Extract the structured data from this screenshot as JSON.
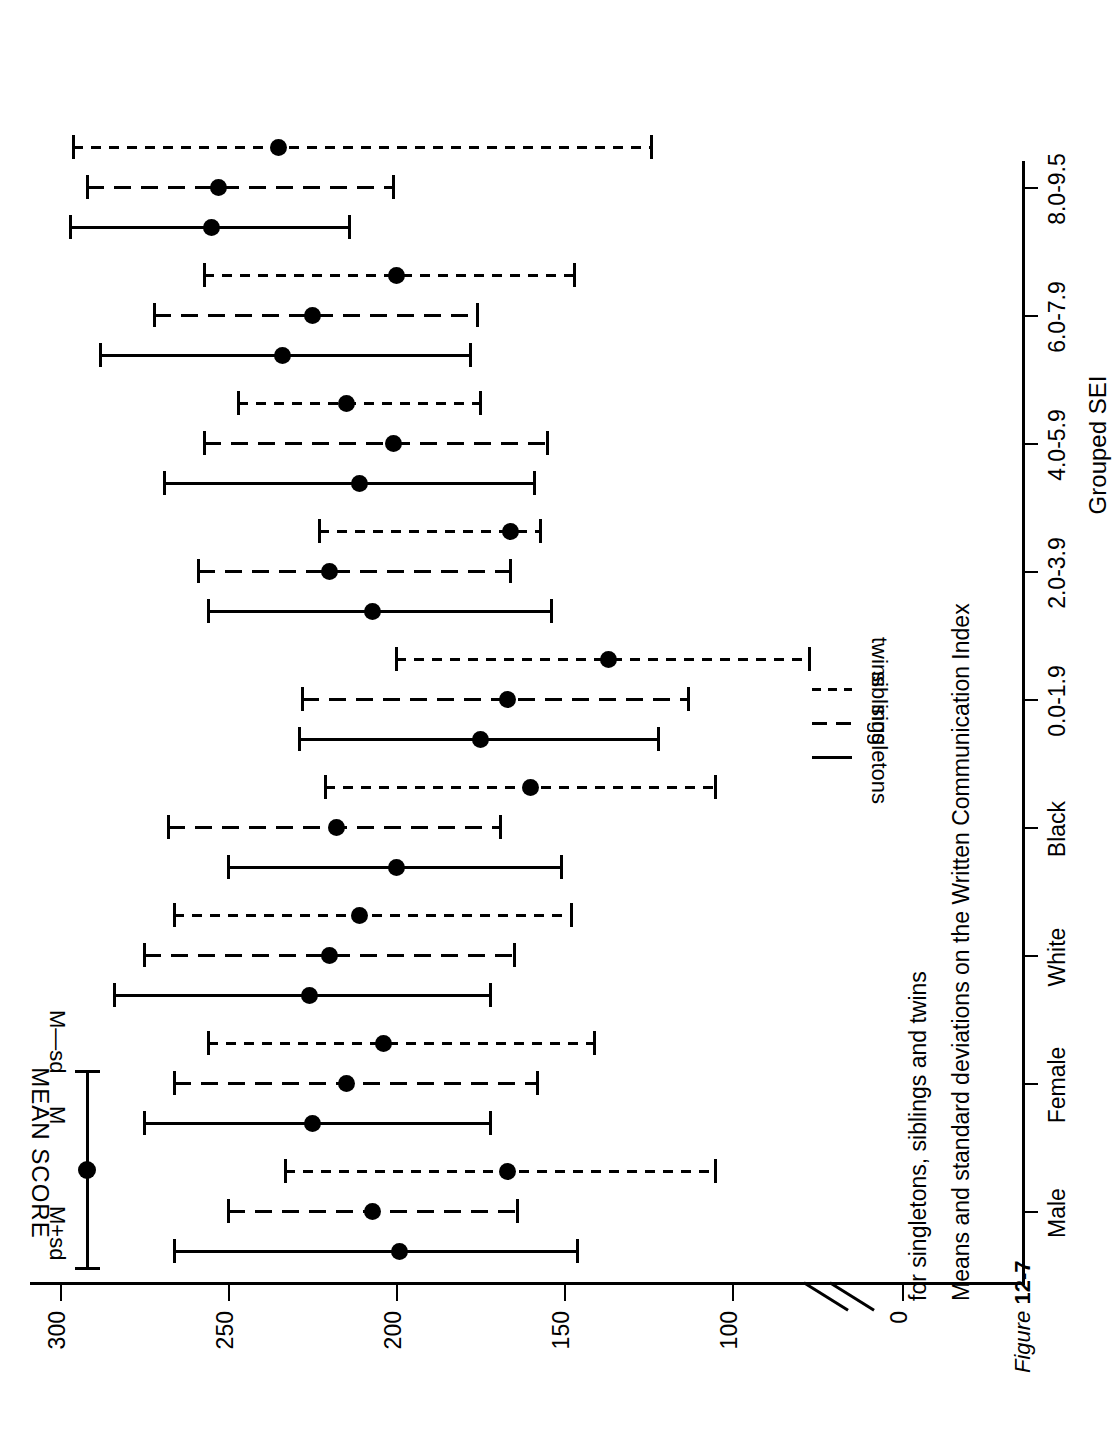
{
  "figure": {
    "label_prefix": "Figure ",
    "label_number": "12-7",
    "title_line1": "Means and standard deviations on the Written Communication Index",
    "title_line2": "for singletons, siblings and twins"
  },
  "axes": {
    "y_title": "MEAN SCORE",
    "x_title": "Grouped SEI",
    "y_ticks": [
      "300",
      "250",
      "200",
      "150",
      "100",
      "0"
    ],
    "y_tick_values": [
      300,
      250,
      200,
      150,
      100,
      0
    ],
    "axis_break": true
  },
  "legend_series": {
    "items": [
      {
        "label": "singletons",
        "style": "solid"
      },
      {
        "label": "siblings",
        "style": "dashed"
      },
      {
        "label": "twins",
        "style": "dotted"
      }
    ]
  },
  "legend_key": {
    "upper_label": "M+sd",
    "mid_label": "M",
    "lower_label": "M—sd"
  },
  "chart_data": {
    "type": "scatter",
    "title": "Means and standard deviations on the Written Communication Index for singletons, siblings and twins",
    "xlabel": "Grouped SEI",
    "ylabel": "MEAN SCORE",
    "orientation": "horizontal-error-bars",
    "ylim": [
      0,
      300
    ],
    "yticks": [
      0,
      100,
      150,
      200,
      250,
      300
    ],
    "grid": false,
    "legend_position": "right",
    "axis_break_between": [
      0,
      100
    ],
    "categories": [
      "Male",
      "Female",
      "White",
      "Black",
      "0.0-1.9",
      "2.0-3.9",
      "4.0-5.9",
      "6.0-7.9",
      "8.0-9.5"
    ],
    "series": [
      {
        "name": "singletons",
        "style": "solid",
        "mean": [
          199,
          225,
          226,
          200,
          175,
          207,
          211,
          234,
          255
        ],
        "m_plus_sd": [
          266,
          275,
          284,
          250,
          229,
          256,
          269,
          288,
          297
        ],
        "m_minus_sd": [
          146,
          172,
          172,
          151,
          122,
          154,
          159,
          178,
          214
        ]
      },
      {
        "name": "siblings",
        "style": "dashed",
        "mean": [
          207,
          215,
          220,
          218,
          167,
          220,
          201,
          225,
          253
        ],
        "m_plus_sd": [
          250,
          266,
          275,
          268,
          228,
          259,
          257,
          272,
          292
        ],
        "m_minus_sd": [
          164,
          158,
          165,
          169,
          113,
          166,
          155,
          176,
          201
        ]
      },
      {
        "name": "twins",
        "style": "dotted",
        "mean": [
          167,
          204,
          211,
          160,
          137,
          166,
          215,
          200,
          235
        ],
        "m_plus_sd": [
          233,
          256,
          266,
          221,
          200,
          223,
          247,
          257,
          296
        ],
        "m_minus_sd": [
          105,
          141,
          148,
          105,
          77,
          157,
          175,
          147,
          124
        ]
      }
    ]
  }
}
